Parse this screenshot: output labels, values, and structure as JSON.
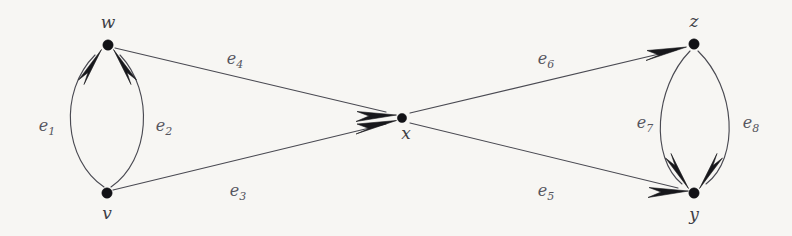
{
  "figure": {
    "kind": "directed-multigraph",
    "background_color": "#f7f6f3",
    "stroke_color": "#4a4a52",
    "vertex_color": "#121216",
    "label_color": "#55555e",
    "width": 792,
    "height": 236
  },
  "vertices": [
    {
      "id": "w",
      "label": "w",
      "x": 108,
      "y": 45,
      "label_x": 108,
      "label_y": 28,
      "label_pos": "above"
    },
    {
      "id": "v",
      "label": "v",
      "x": 107,
      "y": 193,
      "label_x": 107,
      "label_y": 219,
      "label_pos": "below"
    },
    {
      "id": "x",
      "label": "x",
      "x": 402,
      "y": 118,
      "label_x": 406,
      "label_y": 139,
      "label_pos": "below"
    },
    {
      "id": "z",
      "label": "z",
      "x": 694,
      "y": 44,
      "label_x": 694,
      "label_y": 27,
      "label_pos": "above"
    },
    {
      "id": "y",
      "label": "y",
      "x": 694,
      "y": 193,
      "label_x": 694,
      "label_y": 220,
      "label_pos": "below"
    }
  ],
  "edges": [
    {
      "id": "e1",
      "base": "e",
      "sub": "1",
      "from": "v",
      "to": "w",
      "shape": "curve",
      "bulge": "left",
      "label_x": 47,
      "label_y": 131
    },
    {
      "id": "e2",
      "base": "e",
      "sub": "2",
      "from": "v",
      "to": "w",
      "shape": "curve",
      "bulge": "right",
      "label_x": 164,
      "label_y": 131
    },
    {
      "id": "e3",
      "base": "e",
      "sub": "3",
      "from": "v",
      "to": "x",
      "shape": "line",
      "bulge": "none",
      "label_x": 238,
      "label_y": 196
    },
    {
      "id": "e4",
      "base": "e",
      "sub": "4",
      "from": "w",
      "to": "x",
      "shape": "line",
      "bulge": "none",
      "label_x": 235,
      "label_y": 64
    },
    {
      "id": "e5",
      "base": "e",
      "sub": "5",
      "from": "x",
      "to": "y",
      "shape": "line",
      "bulge": "none",
      "label_x": 546,
      "label_y": 196
    },
    {
      "id": "e6",
      "base": "e",
      "sub": "6",
      "from": "x",
      "to": "z",
      "shape": "line",
      "bulge": "none",
      "label_x": 546,
      "label_y": 64
    },
    {
      "id": "e7",
      "base": "e",
      "sub": "7",
      "from": "z",
      "to": "y",
      "shape": "curve",
      "bulge": "left",
      "label_x": 645,
      "label_y": 128
    },
    {
      "id": "e8",
      "base": "e",
      "sub": "8",
      "from": "z",
      "to": "y",
      "shape": "curve",
      "bulge": "right",
      "label_x": 751,
      "label_y": 128
    }
  ]
}
